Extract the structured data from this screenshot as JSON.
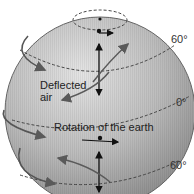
{
  "diagram": {
    "labels": {
      "deflected_air": [
        "Deflected",
        "air"
      ],
      "rotation": "Rotation of the earth",
      "lat_north_60": "60°",
      "lat_equator": "0°",
      "lat_south_60": "60°"
    },
    "colors": {
      "sphere_light": "#dcdcdc",
      "sphere_mid": "#b8b8b8",
      "sphere_dark": "#8a8a8a",
      "outline": "#555555",
      "dashed_line": "#444444",
      "arrow_black": "#111111",
      "arrow_gray": "#5a5a5a",
      "background": "#ffffff"
    },
    "elements": [
      "polar circle (north)",
      "60° N latitude line",
      "equator (0°)",
      "60° S latitude line",
      "vertical meridian double arrows",
      "rotation arrows at north pole, equator",
      "deflected air curved arrows",
      "outer rotation swirl arrows on left edge"
    ]
  }
}
